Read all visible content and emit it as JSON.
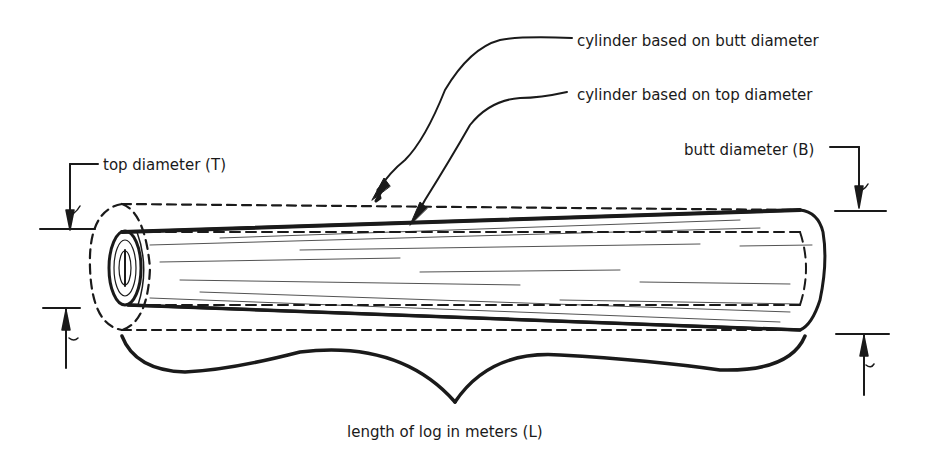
{
  "diagram": {
    "labels": {
      "butt_cylinder": "cylinder based on butt diameter",
      "top_cylinder": "cylinder based on top diameter",
      "top_diameter": "top diameter (T)",
      "butt_diameter": "butt diameter (B)",
      "length": "length of log in meters (L)"
    },
    "colors": {
      "ink": "#1a1a1a",
      "background": "#ffffff"
    }
  }
}
